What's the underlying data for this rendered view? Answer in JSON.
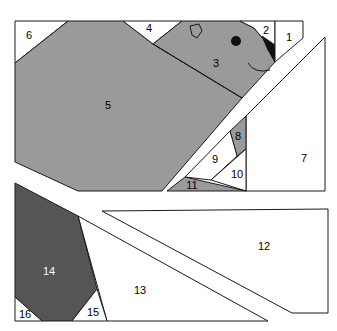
{
  "diagram": {
    "type": "paper-piecing-pattern",
    "colors": {
      "white": "#ffffff",
      "medium_gray": "#9a9a9a",
      "dark_gray": "#555555",
      "black": "#111111",
      "outline": "#1a1a1a"
    },
    "sections": [
      {
        "name": "top-section",
        "pieces": [
          {
            "id": "1",
            "label": "1",
            "fill": "white"
          },
          {
            "id": "2",
            "label": "2",
            "fill": "white"
          },
          {
            "id": "3",
            "label": "3",
            "fill": "medium_gray"
          },
          {
            "id": "4",
            "label": "4",
            "fill": "white"
          },
          {
            "id": "5",
            "label": "5",
            "fill": "medium_gray"
          },
          {
            "id": "6",
            "label": "6",
            "fill": "white"
          }
        ],
        "details": [
          {
            "id": "eye",
            "label": "",
            "fill": "black"
          },
          {
            "id": "nostril",
            "label": "",
            "fill": "none"
          },
          {
            "id": "beak-shadow",
            "label": "",
            "fill": "black"
          },
          {
            "id": "smile",
            "label": "",
            "fill": "none"
          }
        ]
      },
      {
        "name": "middle-right-section",
        "pieces": [
          {
            "id": "7",
            "label": "7",
            "fill": "white"
          },
          {
            "id": "8",
            "label": "8",
            "fill": "medium_gray"
          },
          {
            "id": "9",
            "label": "9",
            "fill": "white"
          },
          {
            "id": "10",
            "label": "10",
            "fill": "white"
          },
          {
            "id": "11",
            "label": "11",
            "fill": "medium_gray"
          }
        ]
      },
      {
        "name": "right-section",
        "pieces": [
          {
            "id": "12",
            "label": "12",
            "fill": "white"
          }
        ]
      },
      {
        "name": "bottom-left-section",
        "pieces": [
          {
            "id": "13",
            "label": "13",
            "fill": "white"
          },
          {
            "id": "14",
            "label": "14",
            "fill": "dark_gray"
          },
          {
            "id": "15",
            "label": "15",
            "fill": "white"
          },
          {
            "id": "16",
            "label": "16",
            "fill": "white"
          }
        ]
      }
    ]
  }
}
